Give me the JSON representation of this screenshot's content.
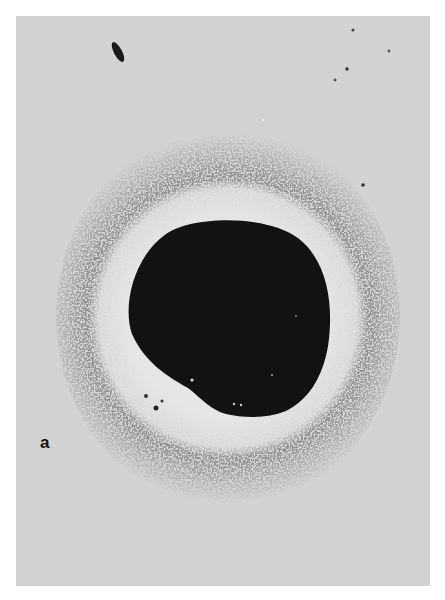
{
  "figure": {
    "panel_label": "a",
    "colors": {
      "background": "#d4d4d4",
      "page": "#ffffff",
      "disk": "#111111",
      "clear_ring": "#e2e2e2",
      "halo_speckle": "#6a6a6a",
      "label": "#111111"
    },
    "geometry": {
      "panel": {
        "x": 16,
        "y": 16,
        "width": 414,
        "height": 570
      },
      "disk_center": {
        "x": 228,
        "y": 318
      },
      "disk_radius": 100,
      "clear_ring_outer_radius": 135,
      "halo_outer_radius": 180
    }
  }
}
